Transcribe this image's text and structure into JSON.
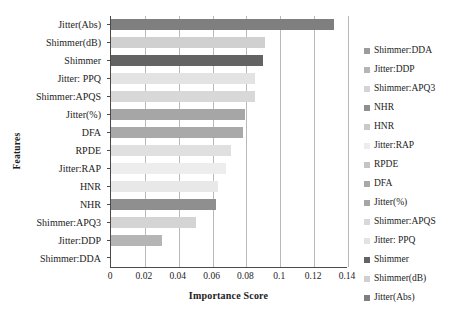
{
  "chart_data": {
    "type": "bar",
    "orientation": "horizontal",
    "title": "",
    "xlabel": "Importance Score",
    "ylabel": "Features",
    "xlim": [
      0,
      0.14
    ],
    "xticks": [
      "0",
      "0.02",
      "0.04",
      "0.06",
      "0.08",
      "0.1",
      "0.12",
      "0.14"
    ],
    "xtick_values": [
      0,
      0.02,
      0.04,
      0.06,
      0.08,
      0.1,
      0.12,
      0.14
    ],
    "grid": "vertical",
    "legend_position": "right",
    "categories": [
      "Jitter(Abs)",
      "Shimmer(dB)",
      "Shimmer",
      "Jitter: PPQ",
      "Shimmer:APQS",
      "Jitter(%)",
      "DFA",
      "RPDE",
      "Jitter:RAP",
      "HNR",
      "NHR",
      "Shimmer:APQ3",
      "Jitter:DDP",
      "Shimmer:DDA"
    ],
    "values": [
      0.132,
      0.091,
      0.09,
      0.085,
      0.085,
      0.079,
      0.078,
      0.071,
      0.068,
      0.063,
      0.062,
      0.05,
      0.03,
      0.0
    ],
    "colors": [
      "#7f7f7f",
      "#d0d0d0",
      "#636363",
      "#e3e3e3",
      "#d8d8d8",
      "#a6a6a6",
      "#a9a9a9",
      "#e0e0e0",
      "#ededed",
      "#e8e8e8",
      "#8f8f8f",
      "#d4d4d4",
      "#b5b5b5",
      "#ffffff"
    ],
    "legend": [
      {
        "label": "Shimmer:DDA",
        "color": "#9c9c9c"
      },
      {
        "label": "Jitter:DDP",
        "color": "#b5b5b5"
      },
      {
        "label": "Shimmer:APQ3",
        "color": "#d4d4d4"
      },
      {
        "label": "NHR",
        "color": "#8f8f8f"
      },
      {
        "label": "HNR",
        "color": "#c9c9c9"
      },
      {
        "label": "Jitter:RAP",
        "color": "#ededed"
      },
      {
        "label": "RPDE",
        "color": "#c4c4c4"
      },
      {
        "label": "DFA",
        "color": "#a9a9a9"
      },
      {
        "label": "Jitter(%)",
        "color": "#a6a6a6"
      },
      {
        "label": "Shimmer:APQS",
        "color": "#d8d8d8"
      },
      {
        "label": "Jitter: PPQ",
        "color": "#e3e3e3"
      },
      {
        "label": "Shimmer",
        "color": "#636363"
      },
      {
        "label": "Shimmer(dB)",
        "color": "#d0d0d0"
      },
      {
        "label": "Jitter(Abs)",
        "color": "#7f7f7f"
      }
    ]
  }
}
